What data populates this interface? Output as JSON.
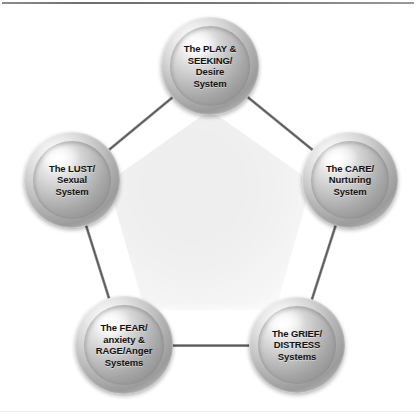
{
  "figure": {
    "background_color": "#ffffff",
    "rule_color": "#6e6e6e",
    "sphere_base_color": "#b4b4b4",
    "sphere_highlight_color": "#fdfdfd",
    "sphere_shadow_color": "#8a8a8a",
    "connector_color": "#555555",
    "label_color": "#111111",
    "center_wash_color": "#eeeeee"
  },
  "nodes": [
    {
      "id": "play-seeking",
      "label": "The PLAY &\nSEEKING/\nDesire\nSystem",
      "lines": [
        "The PLAY &",
        "SEEKING/",
        "Desire",
        "System"
      ],
      "cx": 210,
      "cy": 66,
      "r": 49
    },
    {
      "id": "care-nurturing",
      "label": "The CARE/\nNurturing\nSystem",
      "lines": [
        "The CARE/",
        "Nurturing",
        "System"
      ],
      "cx": 350,
      "cy": 180,
      "r": 48
    },
    {
      "id": "grief-distress",
      "label": "The GRIEF/\nDISTRESS\nSystems",
      "lines": [
        "The GRIEF/",
        "DISTRESS",
        "Systems"
      ],
      "cx": 297,
      "cy": 345,
      "r": 48
    },
    {
      "id": "fear-rage",
      "label": "The FEAR/\nanxiety &\nRAGE/Anger\nSystems",
      "lines": [
        "The FEAR/",
        "anxiety &",
        "RAGE/Anger",
        "Systems"
      ],
      "cx": 124,
      "cy": 345,
      "r": 49
    },
    {
      "id": "lust-sexual",
      "label": "The LUST/\nSexual\nSystem",
      "lines": [
        "The LUST/",
        "Sexual",
        "System"
      ],
      "cx": 72,
      "cy": 180,
      "r": 48
    }
  ],
  "connectors": [
    {
      "id": "lust-to-play",
      "from": "lust-sexual",
      "to": "play-seeking"
    },
    {
      "id": "play-to-care",
      "from": "play-seeking",
      "to": "care-nurturing"
    },
    {
      "id": "care-to-grief",
      "from": "care-nurturing",
      "to": "grief-distress"
    },
    {
      "id": "grief-to-fear",
      "from": "grief-distress",
      "to": "fear-rage"
    },
    {
      "id": "fear-to-lust",
      "from": "fear-rage",
      "to": "lust-sexual"
    }
  ]
}
